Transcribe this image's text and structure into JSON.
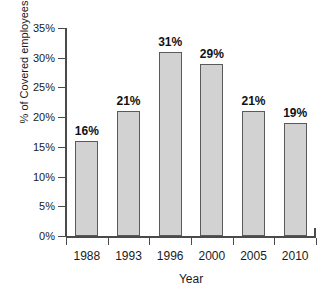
{
  "chart_data": {
    "type": "bar",
    "title": "",
    "xlabel": "Year",
    "ylabel": "% of Covered employees",
    "categories": [
      "1988",
      "1993",
      "1996",
      "2000",
      "2005",
      "2010"
    ],
    "values": [
      16,
      31,
      29,
      21,
      19,
      21
    ],
    "series": [
      {
        "name": "% of Covered employees",
        "values": [
          16,
          21,
          31,
          29,
          21,
          19
        ]
      }
    ],
    "data_labels": [
      "16%",
      "21%",
      "31%",
      "29%",
      "21%",
      "19%"
    ],
    "ylim": [
      0,
      35
    ],
    "ytick_values": [
      0,
      5,
      10,
      15,
      20,
      25,
      30,
      35
    ],
    "ytick_labels": [
      "0%",
      "5%",
      "10%",
      "15%",
      "20%",
      "25%",
      "30%",
      "35%"
    ],
    "grid": false,
    "legend": "none",
    "bar_fill_color": "#d2d2d2",
    "bar_border_color": "#5a5a5a",
    "axis_color": "#4a4a4a",
    "background_color": "#ffffff"
  },
  "clipped_title_remnant": "",
  "axis": {
    "x_title": "Year",
    "y_title": "% of Covered employees"
  }
}
